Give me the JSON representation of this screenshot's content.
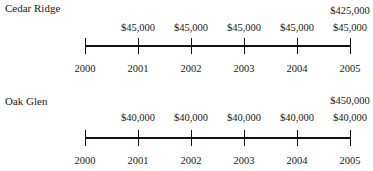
{
  "timelines": [
    {
      "title": "Cedar Ridge",
      "years": [
        "2000",
        "2001",
        "2002",
        "2003",
        "2004",
        "2005"
      ],
      "cash_flows": [
        "",
        "$45,000",
        "$45,000",
        "$45,000",
        "$45,000",
        "$45,000"
      ],
      "extra_final": "$425,000"
    },
    {
      "title": "Oak Glen",
      "years": [
        "2000",
        "2001",
        "2002",
        "2003",
        "2004",
        "2005"
      ],
      "cash_flows": [
        "",
        "$40,000",
        "$40,000",
        "$40,000",
        "$40,000",
        "$40,000"
      ],
      "extra_final": "$450,000"
    }
  ]
}
